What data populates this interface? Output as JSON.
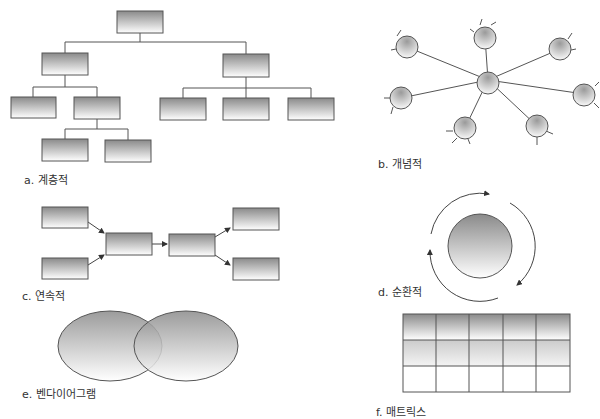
{
  "diagrams": {
    "hierarchical": {
      "label": "a. 계층적"
    },
    "conceptual": {
      "label": "b. 개념적"
    },
    "sequential": {
      "label": "c. 연속적"
    },
    "circular": {
      "label": "d. 순환적"
    },
    "venn": {
      "label": "e. 벤다이어그램"
    },
    "matrix": {
      "label": "f. 매트릭스",
      "rows": 3,
      "cols": 5
    }
  },
  "colors": {
    "stroke": "#555555",
    "gradient_top": "#8c8c8c",
    "gradient_bottom": "#ffffff",
    "label": "#333333"
  }
}
